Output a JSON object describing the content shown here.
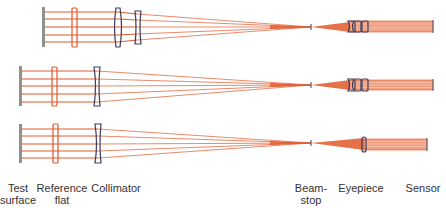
{
  "labels": {
    "test_surface": "Test\nsurface",
    "test_surface_l1": "Test",
    "test_surface_l2": "surface",
    "reference_flat_l1": "Reference",
    "reference_flat_l2": "flat",
    "collimator": "Collimator",
    "beam_stop_l1": "Beam-",
    "beam_stop_l2": "stop",
    "eyepiece": "Eyepiece",
    "sensor": "Sensor"
  },
  "colors": {
    "ray": "#e0582a",
    "lens": "#3c3c5c",
    "test_surface": "#909090",
    "beam_fill": "#f0a080"
  },
  "rows": [
    {
      "name": "configuration-1",
      "test_surface_x": 43,
      "ref_flat_x": 74,
      "collimator_x": 118,
      "second_lens_x": 137,
      "ray_ys": [
        12,
        19,
        27,
        35,
        42
      ],
      "focus": [
        311,
        27
      ],
      "eyepiece_lenses": 3,
      "sensor_x": 433
    },
    {
      "name": "configuration-2",
      "test_surface_x": 20,
      "ref_flat_x": 54,
      "collimator_x": 97,
      "ray_ys": [
        71,
        79,
        86,
        94,
        102
      ],
      "focus": [
        311,
        85
      ],
      "eyepiece_lenses": 3,
      "sensor_x": 433
    },
    {
      "name": "configuration-3",
      "test_surface_x": 20,
      "ref_flat_x": 55,
      "collimator_x": 98,
      "ray_ys": [
        129,
        136,
        144,
        151,
        158
      ],
      "focus": [
        311,
        143
      ],
      "eyepiece_lenses": 1,
      "sensor_x": 427
    }
  ]
}
